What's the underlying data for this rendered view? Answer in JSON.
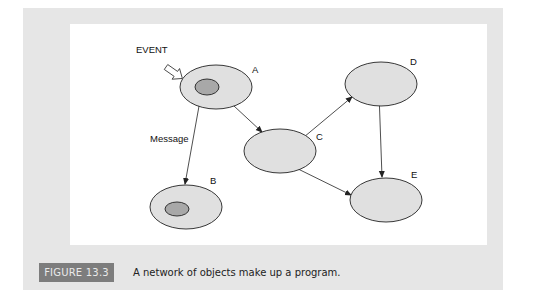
{
  "figure": {
    "label": "FIGURE 13.3",
    "caption": "A network of objects make up a program."
  },
  "diagram": {
    "event_label": "EVENT",
    "message_label": "Message",
    "colors": {
      "outer_fill": "#e0e0e0",
      "inner_fill": "#a8a8a8",
      "stroke": "#222222",
      "panel": "#e6e6e6",
      "label_bg": "#7d7d7d"
    },
    "nodes": [
      {
        "id": "A",
        "label": "A",
        "has_inner": true
      },
      {
        "id": "B",
        "label": "B",
        "has_inner": true
      },
      {
        "id": "C",
        "label": "C",
        "has_inner": false
      },
      {
        "id": "D",
        "label": "D",
        "has_inner": false
      },
      {
        "id": "E",
        "label": "E",
        "has_inner": false
      }
    ],
    "edges": [
      {
        "from": "A",
        "to": "B",
        "label": "Message"
      },
      {
        "from": "A",
        "to": "C",
        "label": ""
      },
      {
        "from": "C",
        "to": "D",
        "label": ""
      },
      {
        "from": "C",
        "to": "E",
        "label": ""
      },
      {
        "from": "D",
        "to": "E",
        "label": ""
      }
    ]
  }
}
